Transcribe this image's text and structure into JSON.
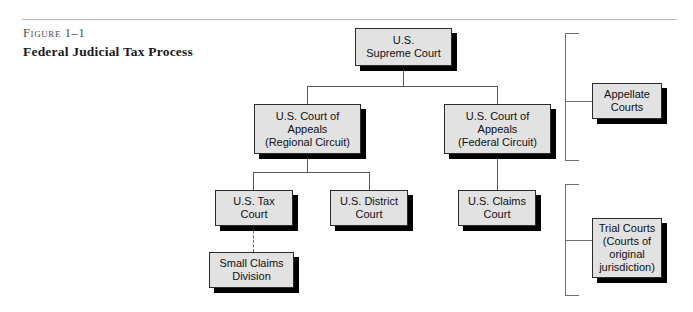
{
  "figure": {
    "label": "Figure 1–1",
    "title": "Federal Judicial Tax Process"
  },
  "diagram": {
    "type": "org-chart",
    "colors": {
      "box_fill": "#e2e2e2",
      "box_border": "#2b2b2b",
      "box_shadow": "#000000",
      "connector": "#565659",
      "bracket": "#6f6f73",
      "rule": "#b9b9bd",
      "text": "#101014"
    },
    "nodes": [
      {
        "id": "supreme-court",
        "text": "U.S.\nSupreme Court",
        "level": 1,
        "x": 355,
        "y": 28,
        "w": 97,
        "h": 38
      },
      {
        "id": "appeals-regional",
        "text": "U.S. Court of\nAppeals\n(Regional Circuit)",
        "level": 2,
        "x": 254,
        "y": 104,
        "w": 107,
        "h": 50
      },
      {
        "id": "appeals-federal",
        "text": "U.S. Court of\nAppeals\n(Federal Circuit)",
        "level": 2,
        "x": 444,
        "y": 104,
        "w": 107,
        "h": 50
      },
      {
        "id": "tax-court",
        "text": "U.S. Tax\nCourt",
        "level": 3,
        "x": 215,
        "y": 190,
        "w": 78,
        "h": 36
      },
      {
        "id": "district-court",
        "text": "U.S. District\nCourt",
        "level": 3,
        "x": 330,
        "y": 190,
        "w": 78,
        "h": 36
      },
      {
        "id": "claims-court",
        "text": "U.S. Claims\nCourt",
        "level": 3,
        "x": 458,
        "y": 190,
        "w": 78,
        "h": 36
      },
      {
        "id": "small-claims",
        "text": "Small Claims\nDivision",
        "level": 4,
        "x": 209,
        "y": 252,
        "w": 85,
        "h": 36
      }
    ],
    "groups": [
      {
        "id": "appellate-courts",
        "text": "Appellate\nCourts",
        "x": 592,
        "y": 83,
        "w": 70,
        "h": 36,
        "bracket": {
          "x": 565,
          "y": 33,
          "w": 14,
          "h": 128
        },
        "stub": {
          "x": 565,
          "y": 101,
          "w": 27
        }
      },
      {
        "id": "trial-courts",
        "text": "Trial Courts\n(Courts of\noriginal\njurisdiction)",
        "x": 592,
        "y": 218,
        "w": 70,
        "h": 60,
        "bracket": {
          "x": 565,
          "y": 184,
          "w": 14,
          "h": 112
        },
        "stub": {
          "x": 565,
          "y": 240,
          "w": 27
        }
      }
    ],
    "edges": [
      {
        "id": "supreme-to-bus",
        "style": "solid"
      },
      {
        "id": "bus-to-appeals-regional",
        "style": "solid"
      },
      {
        "id": "bus-to-appeals-federal",
        "style": "solid"
      },
      {
        "id": "regional-to-tax",
        "style": "solid"
      },
      {
        "id": "regional-to-district",
        "style": "solid"
      },
      {
        "id": "federal-to-claims",
        "style": "solid"
      },
      {
        "id": "tax-to-small-claims",
        "style": "dashed"
      }
    ]
  }
}
